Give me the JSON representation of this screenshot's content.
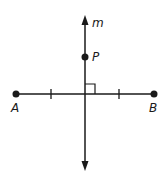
{
  "diagram": {
    "type": "geometry-perpendicular-bisector",
    "colors": {
      "stroke": "#1a1a1a",
      "background": "#ffffff"
    },
    "line_m": {
      "label": "m",
      "x": 85,
      "y_top": 17,
      "y_bottom": 169
    },
    "segment_AB": {
      "y": 94,
      "x_start": 16,
      "x_end": 154
    },
    "points": [
      {
        "name": "A",
        "label": "A",
        "x": 16,
        "y": 94
      },
      {
        "name": "B",
        "label": "B",
        "x": 154,
        "y": 94
      },
      {
        "name": "P",
        "label": "P",
        "x": 85,
        "y": 57
      }
    ],
    "tick_marks": [
      {
        "x": 51,
        "y": 94
      },
      {
        "x": 119,
        "y": 94
      }
    ],
    "right_angle": {
      "x": 85,
      "y": 84,
      "size": 10
    }
  }
}
